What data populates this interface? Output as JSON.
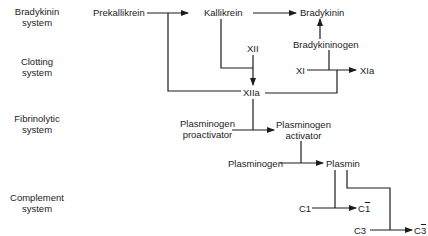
{
  "systems": [
    {
      "line1": "Bradykinin",
      "line2": "system"
    },
    {
      "line1": "Clotting",
      "line2": "system"
    },
    {
      "line1": "Fibrinolytic",
      "line2": "system"
    },
    {
      "line1": "Complement",
      "line2": "system"
    }
  ],
  "nodes": {
    "prekallikrein": "Prekallikrein",
    "kallikrein": "Kallikrein",
    "bradykinin": "Bradykinin",
    "bradykininogen": "Bradykininogen",
    "xii": "XII",
    "xiia": "XIIa",
    "xi": "XI",
    "xia": "XIa",
    "plasminogen_proactivator_line1": "Plasminogen",
    "plasminogen_proactivator_line2": "proactivator",
    "plasminogen_activator_line1": "Plasminogen",
    "plasminogen_activator_line2": "activator",
    "plasminogen": "Plasminogen",
    "plasmin": "Plasmin",
    "c1": "C1",
    "c1_active_base": "C",
    "c1_active_bar": "1",
    "c3": "C3",
    "c3_active_base": "C",
    "c3_active_bar": "3"
  },
  "colors": {
    "line": "#1c1c1c",
    "background": "#ffffff"
  }
}
